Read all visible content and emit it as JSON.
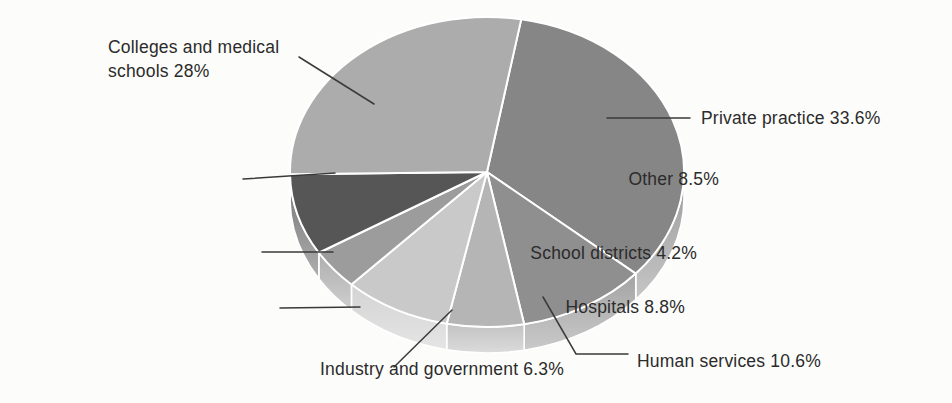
{
  "page": {
    "background": "#fcfcfa",
    "figure_kind": "3d-pie-chart"
  },
  "chart_data": {
    "type": "pie",
    "title": "",
    "unit": "%",
    "legend": "none",
    "labels_style": "outside-with-leader-lines",
    "slices": [
      {
        "id": "private",
        "label": "Private practice",
        "value": 33.6,
        "label_text": "Private practice 33.6%",
        "color": "#868686"
      },
      {
        "id": "human",
        "label": "Human services",
        "value": 10.6,
        "label_text": "Human services 10.6%",
        "color": "#8f8f8f"
      },
      {
        "id": "industry",
        "label": "Industry and government",
        "value": 6.3,
        "label_text": "Industry and government 6.3%",
        "color": "#b5b5b5"
      },
      {
        "id": "hospitals",
        "label": "Hospitals",
        "value": 8.8,
        "label_text": "Hospitals 8.8%",
        "color": "#c9c9c9"
      },
      {
        "id": "school",
        "label": "School districts",
        "value": 4.2,
        "label_text": "School districts 4.2%",
        "color": "#9c9c9c"
      },
      {
        "id": "other",
        "label": "Other",
        "value": 8.5,
        "label_text": "Other 8.5%",
        "color": "#565656"
      },
      {
        "id": "colleges",
        "label": "Colleges and medical schools",
        "value": 28,
        "label_text": "Colleges and medical schools 28%",
        "color": "#acacac"
      }
    ],
    "style": {
      "effect": "3d",
      "separator_color": "#ffffff",
      "leader_line_color": "#3a3a3a",
      "label_color": "#2b2b2b",
      "start_angle_deg": 10,
      "clockwise": true
    }
  }
}
